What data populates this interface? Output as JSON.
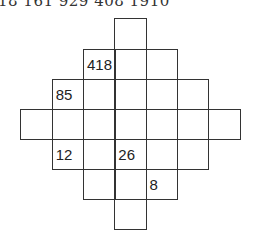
{
  "header": {
    "text": "18 161 929 408 1910"
  },
  "puzzle": {
    "origin_x": 21,
    "origin_y": 19,
    "cell_w": 31.3,
    "cell_h": 30.1,
    "rows": [
      {
        "row": 0,
        "cells": [
          {
            "col": 3,
            "value": ""
          }
        ]
      },
      {
        "row": 1,
        "cells": [
          {
            "col": 2,
            "value": "418"
          },
          {
            "col": 3,
            "value": ""
          },
          {
            "col": 4,
            "value": ""
          }
        ]
      },
      {
        "row": 2,
        "cells": [
          {
            "col": 1,
            "value": "85"
          },
          {
            "col": 2,
            "value": ""
          },
          {
            "col": 3,
            "value": ""
          },
          {
            "col": 4,
            "value": ""
          },
          {
            "col": 5,
            "value": ""
          }
        ]
      },
      {
        "row": 3,
        "cells": [
          {
            "col": 0,
            "value": ""
          },
          {
            "col": 1,
            "value": ""
          },
          {
            "col": 2,
            "value": ""
          },
          {
            "col": 3,
            "value": ""
          },
          {
            "col": 4,
            "value": ""
          },
          {
            "col": 5,
            "value": ""
          },
          {
            "col": 6,
            "value": ""
          }
        ]
      },
      {
        "row": 4,
        "cells": [
          {
            "col": 1,
            "value": "12"
          },
          {
            "col": 2,
            "value": ""
          },
          {
            "col": 3,
            "value": "26"
          },
          {
            "col": 4,
            "value": ""
          },
          {
            "col": 5,
            "value": ""
          }
        ]
      },
      {
        "row": 5,
        "cells": [
          {
            "col": 2,
            "value": ""
          },
          {
            "col": 3,
            "value": ""
          },
          {
            "col": 4,
            "value": "8"
          }
        ]
      },
      {
        "row": 6,
        "cells": [
          {
            "col": 3,
            "value": ""
          }
        ]
      }
    ]
  }
}
